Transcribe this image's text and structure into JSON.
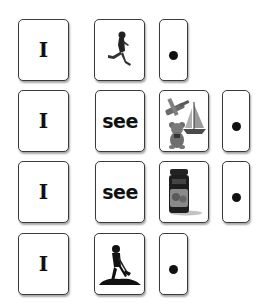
{
  "sentences": [
    {
      "cards": [
        {
          "type": "word",
          "text": "I"
        },
        {
          "type": "picture",
          "icon": "running-child-icon",
          "meaning": "run"
        },
        {
          "type": "punctuation",
          "text": "period"
        }
      ]
    },
    {
      "cards": [
        {
          "type": "word",
          "text": "I"
        },
        {
          "type": "word",
          "text": "see"
        },
        {
          "type": "picture",
          "icon": "toys-icon",
          "meaning": "toys"
        },
        {
          "type": "punctuation",
          "text": "period"
        }
      ]
    },
    {
      "cards": [
        {
          "type": "word",
          "text": "I"
        },
        {
          "type": "word",
          "text": "see"
        },
        {
          "type": "picture",
          "icon": "jam-jar-icon",
          "meaning": "jam"
        },
        {
          "type": "punctuation",
          "text": "period"
        }
      ]
    },
    {
      "cards": [
        {
          "type": "word",
          "text": "I"
        },
        {
          "type": "picture",
          "icon": "digging-person-icon",
          "meaning": "dig"
        },
        {
          "type": "punctuation",
          "text": "period"
        }
      ]
    }
  ],
  "colors": {
    "card_border": "#3a3a3a",
    "ink": "#111111",
    "background": "#ffffff"
  }
}
